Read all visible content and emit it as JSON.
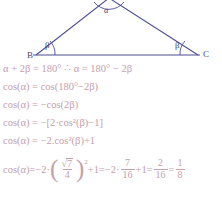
{
  "diagram": {
    "name": "isosceles-triangle",
    "stroke_color": "#4c4c96",
    "vertices": {
      "B": {
        "label": "B",
        "x": 36,
        "y": 55
      },
      "C": {
        "label": "C",
        "x": 198,
        "y": 55
      },
      "A": {
        "label": "",
        "x": 109,
        "y": 0
      }
    },
    "angles": {
      "apex": {
        "label": "α",
        "at": "A"
      },
      "base_left": {
        "label": "β",
        "at": "B"
      },
      "base_right": {
        "label": "β",
        "at": "C"
      }
    },
    "base_line": {
      "from": "B",
      "to": "C"
    }
  },
  "equations": {
    "text_color": "#c4a0ab",
    "lines": [
      {
        "id": "line-1",
        "text": "α + 2β = 180° ∴ α = 180° − 2β"
      },
      {
        "id": "line-2",
        "text": "cos(α) = cos(180°−2β)"
      },
      {
        "id": "line-3",
        "text": "cos(α) = −cos(2β)"
      },
      {
        "id": "line-4",
        "text": "cos(α) = −[2·cos²(β)−1]"
      },
      {
        "id": "line-5",
        "text": "cos(α) = −2.cos²(β)+1"
      }
    ],
    "final_line": {
      "id": "line-6",
      "lhs": "cos(α)",
      "eq1": "=",
      "coef1": "−2·",
      "paren_open": "(",
      "sqrt_symbol": "√",
      "sqrt_radicand": "7",
      "frac1_den": "4",
      "paren_close": ")",
      "exponent": "2",
      "plus1": "+1",
      "eq2": "=",
      "coef2": "−2·",
      "frac2_num": "7",
      "frac2_den": "16",
      "plus1b": "+1",
      "eq3": "=",
      "frac3_num": "2",
      "frac3_den": "16",
      "eq4": "=",
      "frac4_num": "1",
      "frac4_den": "8"
    }
  }
}
